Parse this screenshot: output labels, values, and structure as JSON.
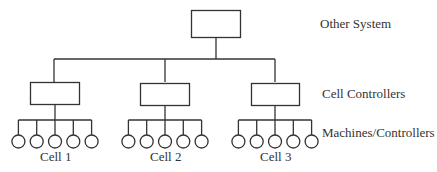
{
  "diagram": {
    "levels": [
      {
        "label": "Other System"
      },
      {
        "label": "Cell Controllers"
      },
      {
        "label": "Machines/Controllers"
      }
    ],
    "cells": [
      {
        "label": "Cell 1",
        "machines": 5
      },
      {
        "label": "Cell 2",
        "machines": 5
      },
      {
        "label": "Cell 3",
        "machines": 5
      }
    ],
    "colors": {
      "stroke": "#333333",
      "background": "#ffffff"
    }
  }
}
